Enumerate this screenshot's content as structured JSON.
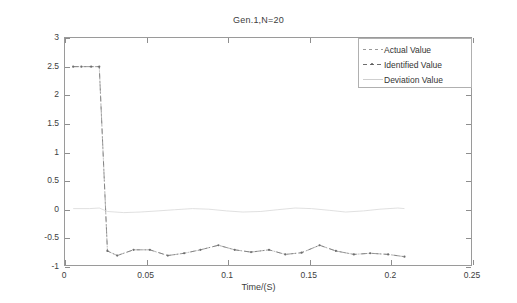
{
  "chart_data": {
    "type": "line",
    "title": "Gen.1,N=20",
    "xlabel": "Time/(S)",
    "ylabel": "Pe1/(p.u.)",
    "xlim": [
      0,
      0.25
    ],
    "ylim": [
      -1,
      3
    ],
    "xticks": [
      "0",
      "0.05",
      "0.1",
      "0.15",
      "0.2",
      "0.25"
    ],
    "xtick_values": [
      0,
      0.05,
      0.1,
      0.15,
      0.2,
      0.25
    ],
    "yticks": [
      "-1",
      "-0.5",
      "0",
      "0.5",
      "1",
      "1.5",
      "2",
      "2.5",
      "3"
    ],
    "ytick_values": [
      -1,
      -0.5,
      0,
      0.5,
      1,
      1.5,
      2,
      2.5,
      3
    ],
    "grid": false,
    "legend_position": "upper right",
    "legend": [
      "Actual Value",
      "Identified Value",
      "Deviation Value"
    ],
    "series": [
      {
        "name": "Actual Value",
        "color": "#9a9a9a",
        "style": "dashed",
        "marker": "none",
        "x": [
          0.005,
          0.01,
          0.016,
          0.021,
          0.026,
          0.032,
          0.042,
          0.052,
          0.063,
          0.073,
          0.083,
          0.094,
          0.104,
          0.114,
          0.125,
          0.135,
          0.145,
          0.156,
          0.166,
          0.177,
          0.187,
          0.198,
          0.208
        ],
        "y": [
          2.5,
          2.5,
          2.5,
          2.5,
          -0.72,
          -0.8,
          -0.7,
          -0.7,
          -0.8,
          -0.76,
          -0.7,
          -0.62,
          -0.7,
          -0.74,
          -0.7,
          -0.78,
          -0.75,
          -0.62,
          -0.72,
          -0.78,
          -0.76,
          -0.78,
          -0.82
        ]
      },
      {
        "name": "Identified Value",
        "color": "#6e6e6e",
        "style": "dash-dot",
        "marker": "dot",
        "x": [
          0.005,
          0.01,
          0.016,
          0.021,
          0.026,
          0.032,
          0.042,
          0.052,
          0.063,
          0.073,
          0.083,
          0.094,
          0.104,
          0.114,
          0.125,
          0.135,
          0.145,
          0.156,
          0.166,
          0.177,
          0.187,
          0.198,
          0.208
        ],
        "y": [
          2.5,
          2.5,
          2.5,
          2.5,
          -0.72,
          -0.8,
          -0.7,
          -0.7,
          -0.8,
          -0.76,
          -0.7,
          -0.62,
          -0.7,
          -0.74,
          -0.7,
          -0.78,
          -0.75,
          -0.62,
          -0.72,
          -0.78,
          -0.76,
          -0.78,
          -0.82
        ]
      },
      {
        "name": "Deviation Value",
        "color": "#d8d8d8",
        "style": "solid",
        "marker": "none",
        "x": [
          0.005,
          0.015,
          0.021,
          0.026,
          0.036,
          0.046,
          0.057,
          0.067,
          0.078,
          0.088,
          0.099,
          0.109,
          0.12,
          0.13,
          0.141,
          0.151,
          0.162,
          0.172,
          0.183,
          0.193,
          0.204,
          0.208
        ],
        "y": [
          0.02,
          0.02,
          0.03,
          -0.03,
          -0.05,
          -0.04,
          -0.02,
          0.0,
          0.02,
          0.01,
          -0.02,
          -0.04,
          -0.03,
          0.0,
          0.03,
          0.02,
          -0.01,
          -0.04,
          -0.02,
          0.01,
          0.03,
          0.02
        ]
      }
    ]
  }
}
